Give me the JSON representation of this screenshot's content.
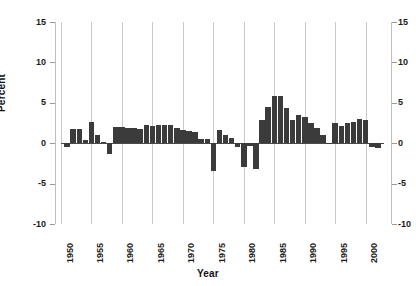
{
  "chart_data": {
    "type": "bar",
    "title": "",
    "xlabel": "Year",
    "ylabel": "Percent",
    "ylim": [
      -10,
      15
    ],
    "yticks": [
      15,
      10,
      5,
      0,
      -5,
      -10
    ],
    "ytick_labels_left": [
      "15",
      "10",
      "5",
      "0",
      "-5",
      "-10"
    ],
    "ytick_labels_right": [
      "15",
      "10",
      "5",
      "0",
      "-5",
      "-10"
    ],
    "xlim": [
      1950,
      2003
    ],
    "xticks": [
      1950,
      1955,
      1960,
      1965,
      1970,
      1975,
      1980,
      1985,
      1990,
      1995,
      2000
    ],
    "xtick_labels": [
      "1950",
      "1955",
      "1960",
      "1965",
      "1970",
      "1975",
      "1980",
      "1985",
      "1990",
      "1995",
      "2000"
    ],
    "grid": "vertical-only",
    "legend": "none",
    "bar_color": "#3b3b3b",
    "gridline_color": "#c9c9c9",
    "axis_color": "#bdbdbd",
    "zero_line_color": "#4a4a4a",
    "categories": [
      1951,
      1952,
      1953,
      1954,
      1955,
      1956,
      1957,
      1958,
      1959,
      1960,
      1961,
      1962,
      1963,
      1964,
      1965,
      1966,
      1967,
      1968,
      1969,
      1970,
      1971,
      1972,
      1973,
      1974,
      1975,
      1976,
      1977,
      1978,
      1979,
      1980,
      1981,
      1982,
      1983,
      1984,
      1985,
      1986,
      1987,
      1988,
      1989,
      1990,
      1991,
      1992,
      1993,
      1994,
      1995,
      1996,
      1997,
      1998,
      1999,
      2000,
      2001,
      2002
    ],
    "values": [
      -0.5,
      1.7,
      1.7,
      0.4,
      2.6,
      1.0,
      0.2,
      -1.3,
      2.0,
      2.0,
      1.9,
      1.9,
      1.8,
      2.2,
      2.1,
      2.3,
      2.2,
      2.2,
      1.9,
      1.6,
      1.5,
      1.4,
      0.5,
      0.5,
      -3.5,
      1.6,
      1.0,
      0.6,
      -0.5,
      -3.0,
      -0.3,
      -3.2,
      2.9,
      4.5,
      5.9,
      5.9,
      4.4,
      2.9,
      3.5,
      3.3,
      2.5,
      1.9,
      1.0,
      -0.1,
      2.5,
      2.1,
      2.5,
      2.6,
      3.0,
      2.9,
      -0.5,
      -0.6
    ]
  }
}
